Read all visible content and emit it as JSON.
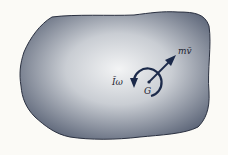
{
  "diagram": {
    "body": {
      "fill_light": "#f2f3f4",
      "fill_dark": "#5d6679",
      "outline": "#2a3040"
    },
    "labels": {
      "momentum": "mv̄",
      "angular_momentum": "Īω",
      "center": "G"
    },
    "colors": {
      "arrow": "#1c2a4a",
      "text": "#1e2433"
    }
  }
}
